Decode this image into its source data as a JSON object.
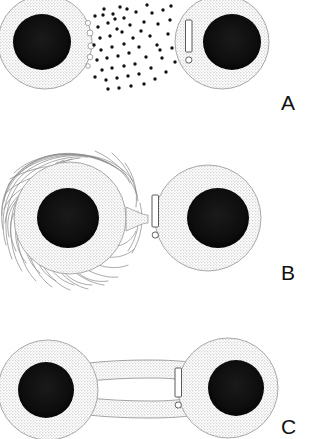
{
  "figure": {
    "type": "biological-schematic",
    "panel_count": 3,
    "width": 316,
    "height": 439,
    "background_color": "#ffffff"
  },
  "colors": {
    "cytoplasm_fill": "#ebebeb",
    "cytoplasm_stroke": "#9a9a9a",
    "nucleus_fill": "#0d0d0d",
    "signal_dot": "#111111",
    "filament_stroke": "#8d8d8d",
    "bridge_fill": "#ebebeb",
    "bridge_lumen": "#ffffff",
    "marker_stroke": "#555555",
    "label_color": "#111111"
  },
  "panels": [
    {
      "id": "a",
      "label": "A",
      "mechanism": "diffusible-signal-secretion",
      "description": "Two separated cells; the left cell releases many small diffusible signal particles that spread across the gap toward the right cell",
      "sender_cell": {
        "name": "left-cell",
        "cx": 45,
        "cy": 42,
        "r": 47,
        "nucleus": {
          "cx": 42,
          "cy": 42,
          "rx": 29,
          "ry": 28
        },
        "clipped_at_left_edge": true
      },
      "receiver_cell": {
        "name": "right-cell",
        "cx": 222,
        "cy": 42,
        "r": 47,
        "nucleus": {
          "cx": 232,
          "cy": 42,
          "rx": 29,
          "ry": 28
        },
        "marker": {
          "type": "exclamation-mark",
          "x": 188,
          "y": 20,
          "w": 7,
          "h": 48
        }
      },
      "signal_particles": {
        "count": 58,
        "shape": "dot",
        "radius": 1.7,
        "region": {
          "x": 88,
          "y": 2,
          "width": 92,
          "height": 84
        }
      },
      "blebs": {
        "count": 5,
        "side": "right-of-sender",
        "note": "small open vesicles budding from sender membrane"
      }
    },
    {
      "id": "b",
      "label": "B",
      "mechanism": "direct-contact-juxtacrine",
      "description": "Two cells in direct membrane contact; the left cell is covered with a fibrous filamentous coat (filopodia) and touches the right cell at a narrow junction",
      "sender_cell": {
        "name": "left-cell",
        "cx": 70,
        "cy": 218,
        "r": 56,
        "nucleus": {
          "cx": 68,
          "cy": 218,
          "rx": 31,
          "ry": 30
        },
        "filament_coat": {
          "present": true,
          "strand_count": 34,
          "style": "wispy-irregular-hairs"
        },
        "clipped_at_left_edge": true
      },
      "receiver_cell": {
        "name": "right-cell",
        "cx": 208,
        "cy": 218,
        "r": 53,
        "nucleus": {
          "cx": 218,
          "cy": 218,
          "rx": 31,
          "ry": 30
        },
        "marker": {
          "type": "exclamation-mark",
          "x": 154,
          "y": 196,
          "w": 7,
          "h": 48
        }
      },
      "contact": {
        "type": "membrane-junction",
        "x": 140,
        "y": 218,
        "width": 16,
        "height": 20
      }
    },
    {
      "id": "c",
      "label": "C",
      "mechanism": "cytoplasmic-bridge-nanotube",
      "description": "Two cells joined by a wide cytoplasmic bridge / tunneling tube with an open white lumen connecting their interiors",
      "sender_cell": {
        "name": "left-cell",
        "cx": 48,
        "cy": 390,
        "r": 50,
        "nucleus": {
          "cx": 46,
          "cy": 390,
          "rx": 28,
          "ry": 28
        },
        "clipped_at_left_edge": true
      },
      "receiver_cell": {
        "name": "right-cell",
        "cx": 228,
        "cy": 388,
        "r": 50,
        "nucleus": {
          "cx": 236,
          "cy": 388,
          "rx": 28,
          "ry": 28
        },
        "marker": {
          "type": "exclamation-mark",
          "x": 176,
          "y": 368,
          "w": 7,
          "h": 44
        }
      },
      "bridge": {
        "name": "cytoplasmic-bridge",
        "x": 88,
        "y": 365,
        "width": 95,
        "height": 60,
        "lumen": {
          "x": 96,
          "y": 386,
          "width": 80,
          "height": 24,
          "fill": "#ffffff"
        }
      }
    }
  ],
  "labels": {
    "a": "A",
    "b": "B",
    "c": "C"
  }
}
